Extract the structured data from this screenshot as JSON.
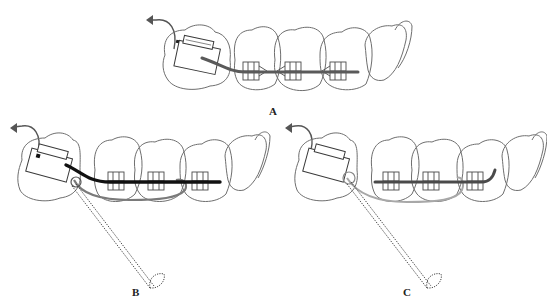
{
  "figure": {
    "panels": [
      {
        "id": "A",
        "label": "A",
        "wire": "dark-gray archwire through three brackets into molar tube",
        "wire_color": "#5a5a5a",
        "has_ligature_tool": false
      },
      {
        "id": "B",
        "label": "B",
        "wire": "black archwire plus gray auxiliary wire looping around brackets",
        "wire_color": "#111111",
        "aux_color": "#7a7a7a",
        "has_ligature_tool": true
      },
      {
        "id": "C",
        "label": "C",
        "wire": "dark-gray archwire with light-gray auxiliary loop",
        "wire_color": "#4a4a4a",
        "aux_color": "#a8a8a8",
        "has_ligature_tool": true
      }
    ],
    "colors": {
      "outline": "#6e6e6e",
      "background": "#ffffff"
    }
  }
}
